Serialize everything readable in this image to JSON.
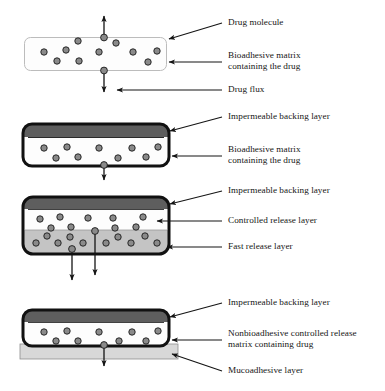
{
  "figure": {
    "type": "diagram",
    "background_color": "#ffffff",
    "colors": {
      "drug_molecule_fill": "#8a8a8a",
      "drug_molecule_stroke": "#1a1a1a",
      "impermeable_backing": "#5e5e5e",
      "matrix_white": "#fdfdfd",
      "fast_release_layer": "#c4c4c4",
      "mucoadhesive_layer": "#d8d8d8",
      "thick_border": "#111111",
      "thin_border": "#b9b9b9",
      "arrow": "#141414",
      "text": "#161616"
    },
    "panels": [
      {
        "id": "panel-1",
        "name": "bioadhesive-matrix-single-layer",
        "border_style": "thin-light-gray-rounded",
        "layers": [
          {
            "name": "bioadhesive-matrix",
            "fill": "#fdfdfd",
            "label_ref": "bioadhesive-matrix"
          }
        ],
        "drug_molecule_count": 14,
        "flux_arrows": [
          "up",
          "down"
        ],
        "labels": [
          {
            "id": "drug-molecule",
            "text": "Drug molecule",
            "lines": [
              "Drug molecule"
            ],
            "leader": "diagonal"
          },
          {
            "id": "bioadhesive-matrix",
            "text": "Bioadhesive matrix containing the drug",
            "lines": [
              "Bioadhesive matrix",
              "containing the drug"
            ],
            "leader": "horizontal"
          },
          {
            "id": "drug-flux",
            "text": "Drug flux",
            "lines": [
              "Drug flux"
            ],
            "leader": "horizontal"
          }
        ]
      },
      {
        "id": "panel-2",
        "name": "backed-bioadhesive-matrix",
        "border_style": "thick-black-rounded",
        "layers": [
          {
            "name": "impermeable-backing-layer",
            "fill": "#5e5e5e",
            "label_ref": "impermeable-backing-layer-2"
          },
          {
            "name": "bioadhesive-matrix",
            "fill": "#fdfdfd",
            "label_ref": "bioadhesive-matrix-2"
          }
        ],
        "drug_molecule_count": 11,
        "flux_arrows": [
          "down"
        ],
        "labels": [
          {
            "id": "impermeable-backing-layer-2",
            "text": "Impermeable backing layer",
            "lines": [
              "Impermeable backing layer"
            ],
            "leader": "diagonal"
          },
          {
            "id": "bioadhesive-matrix-2",
            "text": "Bioadhesive matrix containing the drug",
            "lines": [
              "Bioadhesive matrix",
              "containing the drug"
            ],
            "leader": "horizontal"
          }
        ]
      },
      {
        "id": "panel-3",
        "name": "two-layer-controlled-and-fast-release",
        "border_style": "thick-black-rounded",
        "layers": [
          {
            "name": "impermeable-backing-layer",
            "fill": "#5e5e5e",
            "label_ref": "impermeable-backing-layer-3"
          },
          {
            "name": "controlled-release-layer",
            "fill": "#fdfdfd",
            "label_ref": "controlled-release-layer"
          },
          {
            "name": "fast-release-layer",
            "fill": "#c4c4c4",
            "label_ref": "fast-release-layer"
          }
        ],
        "drug_molecule_count": 24,
        "flux_arrows": [
          "down",
          "down"
        ],
        "labels": [
          {
            "id": "impermeable-backing-layer-3",
            "text": "Impermeable backing layer",
            "lines": [
              "Impermeable backing layer"
            ],
            "leader": "diagonal"
          },
          {
            "id": "controlled-release-layer",
            "text": "Controlled release layer",
            "lines": [
              "Controlled release layer"
            ],
            "leader": "horizontal"
          },
          {
            "id": "fast-release-layer",
            "text": "Fast release layer",
            "lines": [
              "Fast release layer"
            ],
            "leader": "horizontal"
          }
        ]
      },
      {
        "id": "panel-4",
        "name": "nonbioadhesive-matrix-with-mucoadhesive-layer",
        "border_style": "thick-black-rounded",
        "layers": [
          {
            "name": "impermeable-backing-layer",
            "fill": "#5e5e5e",
            "label_ref": "impermeable-backing-layer-4"
          },
          {
            "name": "nonbioadhesive-controlled-release-matrix",
            "fill": "#fdfdfd",
            "label_ref": "nonbioadhesive-matrix"
          },
          {
            "name": "mucoadhesive-layer",
            "fill": "#d8d8d8",
            "label_ref": "mucoadhesive-layer"
          }
        ],
        "drug_molecule_count": 11,
        "flux_arrows": [
          "down"
        ],
        "labels": [
          {
            "id": "impermeable-backing-layer-4",
            "text": "Impermeable backing layer",
            "lines": [
              "Impermeable backing layer"
            ],
            "leader": "diagonal"
          },
          {
            "id": "nonbioadhesive-matrix",
            "text": "Nonbioadhesive controlled release matrix containing drug",
            "lines": [
              "Nonbioadhesive controlled release",
              "matrix containing drug"
            ],
            "leader": "horizontal"
          },
          {
            "id": "mucoadhesive-layer",
            "text": "Mucoadhesive layer",
            "lines": [
              "Mucoadhesive layer"
            ],
            "leader": "diagonal"
          }
        ]
      }
    ],
    "all_label_text": {
      "drug_molecule": "Drug molecule",
      "bioadhesive_matrix_l1": "Bioadhesive matrix",
      "bioadhesive_matrix_l2": "containing the drug",
      "drug_flux": "Drug flux",
      "impermeable_backing_layer": "Impermeable backing layer",
      "controlled_release_layer": "Controlled release layer",
      "fast_release_layer": "Fast release layer",
      "nonbioadhesive_matrix_l1": "Nonbioadhesive controlled release",
      "nonbioadhesive_matrix_l2": "matrix containing drug",
      "mucoadhesive_layer": "Mucoadhesive layer"
    }
  }
}
